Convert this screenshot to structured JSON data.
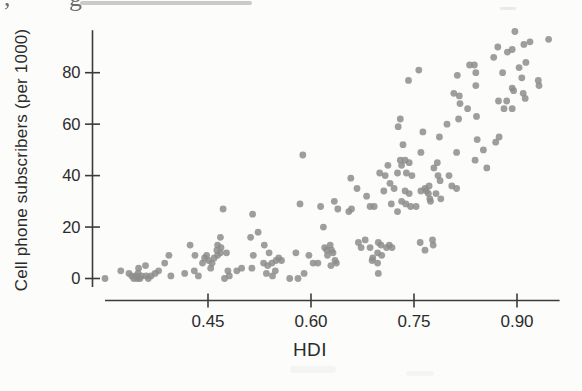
{
  "figure": {
    "artifact_text": ", g",
    "background": "#fcfcfa",
    "dot_color": "#8d8d8d",
    "axis_color": "#3b3b3b",
    "text_color": "#2b2b2b"
  },
  "chart_data": {
    "type": "scatter",
    "title": "",
    "xlabel": "HDI",
    "ylabel": "Cell phone subscribers (per 1000)",
    "x_ticks": [
      0.45,
      0.6,
      0.75,
      0.9
    ],
    "x_tick_labels": [
      "0.45",
      "0.60",
      "0.75",
      "0.90"
    ],
    "y_ticks": [
      0,
      20,
      40,
      60,
      80
    ],
    "y_tick_labels": [
      "0",
      "20",
      "40",
      "60",
      "80"
    ],
    "xlim": [
      0.3,
      0.962
    ],
    "ylim": [
      -8.5,
      96.5
    ],
    "grid": false,
    "legend": null,
    "points": [
      [
        0.3,
        0
      ],
      [
        0.323,
        3
      ],
      [
        0.335,
        2
      ],
      [
        0.339,
        1
      ],
      [
        0.342,
        0
      ],
      [
        0.345,
        1
      ],
      [
        0.348,
        2
      ],
      [
        0.347,
        0
      ],
      [
        0.351,
        0
      ],
      [
        0.353,
        1
      ],
      [
        0.349,
        4
      ],
      [
        0.359,
        5
      ],
      [
        0.36,
        1
      ],
      [
        0.363,
        0
      ],
      [
        0.367,
        1
      ],
      [
        0.373,
        2
      ],
      [
        0.378,
        3
      ],
      [
        0.387,
        6
      ],
      [
        0.393,
        9
      ],
      [
        0.396,
        1
      ],
      [
        0.416,
        2
      ],
      [
        0.424,
        13
      ],
      [
        0.431,
        9
      ],
      [
        0.43,
        3
      ],
      [
        0.436,
        1
      ],
      [
        0.442,
        6
      ],
      [
        0.445,
        8
      ],
      [
        0.448,
        9
      ],
      [
        0.451,
        7
      ],
      [
        0.454,
        4
      ],
      [
        0.456,
        6
      ],
      [
        0.459,
        8
      ],
      [
        0.463,
        11
      ],
      [
        0.464,
        9
      ],
      [
        0.464,
        13
      ],
      [
        0.468,
        10
      ],
      [
        0.469,
        12
      ],
      [
        0.468,
        16
      ],
      [
        0.472,
        27
      ],
      [
        0.474,
        0
      ],
      [
        0.477,
        10
      ],
      [
        0.479,
        3
      ],
      [
        0.481,
        1
      ],
      [
        0.492,
        3
      ],
      [
        0.499,
        4
      ],
      [
        0.512,
        16
      ],
      [
        0.515,
        25
      ],
      [
        0.516,
        9
      ],
      [
        0.514,
        4
      ],
      [
        0.523,
        18
      ],
      [
        0.531,
        6
      ],
      [
        0.532,
        13
      ],
      [
        0.535,
        2
      ],
      [
        0.537,
        5
      ],
      [
        0.539,
        10
      ],
      [
        0.543,
        6
      ],
      [
        0.544,
        1
      ],
      [
        0.548,
        3
      ],
      [
        0.549,
        7
      ],
      [
        0.553,
        8
      ],
      [
        0.557,
        7
      ],
      [
        0.569,
        0
      ],
      [
        0.578,
        10
      ],
      [
        0.581,
        0
      ],
      [
        0.584,
        29
      ],
      [
        0.588,
        48
      ],
      [
        0.59,
        2
      ],
      [
        0.597,
        9
      ],
      [
        0.603,
        6
      ],
      [
        0.61,
        6
      ],
      [
        0.614,
        28
      ],
      [
        0.618,
        20
      ],
      [
        0.62,
        12
      ],
      [
        0.623,
        11
      ],
      [
        0.624,
        9
      ],
      [
        0.628,
        13
      ],
      [
        0.629,
        5
      ],
      [
        0.63,
        11
      ],
      [
        0.632,
        10
      ],
      [
        0.634,
        30
      ],
      [
        0.635,
        7
      ],
      [
        0.637,
        6
      ],
      [
        0.639,
        27
      ],
      [
        0.655,
        26
      ],
      [
        0.659,
        27
      ],
      [
        0.658,
        39
      ],
      [
        0.667,
        35
      ],
      [
        0.669,
        14
      ],
      [
        0.673,
        12
      ],
      [
        0.679,
        15
      ],
      [
        0.681,
        32
      ],
      [
        0.686,
        28
      ],
      [
        0.686,
        12
      ],
      [
        0.689,
        7
      ],
      [
        0.69,
        8
      ],
      [
        0.692,
        28
      ],
      [
        0.697,
        6
      ],
      [
        0.697,
        10
      ],
      [
        0.698,
        2
      ],
      [
        0.698,
        14
      ],
      [
        0.7,
        41
      ],
      [
        0.702,
        13
      ],
      [
        0.703,
        9
      ],
      [
        0.706,
        34
      ],
      [
        0.708,
        40
      ],
      [
        0.71,
        12
      ],
      [
        0.712,
        44
      ],
      [
        0.714,
        13
      ],
      [
        0.715,
        37
      ],
      [
        0.717,
        29
      ],
      [
        0.718,
        12
      ],
      [
        0.721,
        35
      ],
      [
        0.726,
        41
      ],
      [
        0.726,
        26
      ],
      [
        0.727,
        59
      ],
      [
        0.73,
        62
      ],
      [
        0.73,
        46
      ],
      [
        0.732,
        44
      ],
      [
        0.732,
        30
      ],
      [
        0.734,
        52
      ],
      [
        0.737,
        46
      ],
      [
        0.737,
        34
      ],
      [
        0.738,
        29
      ],
      [
        0.739,
        41
      ],
      [
        0.742,
        77
      ],
      [
        0.743,
        45
      ],
      [
        0.743,
        33
      ],
      [
        0.745,
        28
      ],
      [
        0.747,
        40
      ],
      [
        0.753,
        28
      ],
      [
        0.757,
        81
      ],
      [
        0.759,
        14
      ],
      [
        0.76,
        49
      ],
      [
        0.76,
        34
      ],
      [
        0.763,
        57
      ],
      [
        0.766,
        35
      ],
      [
        0.766,
        11
      ],
      [
        0.768,
        34
      ],
      [
        0.771,
        33
      ],
      [
        0.772,
        36
      ],
      [
        0.773,
        31
      ],
      [
        0.774,
        30
      ],
      [
        0.777,
        15
      ],
      [
        0.778,
        13
      ],
      [
        0.779,
        43
      ],
      [
        0.782,
        33
      ],
      [
        0.784,
        45
      ],
      [
        0.785,
        40
      ],
      [
        0.787,
        55
      ],
      [
        0.788,
        38
      ],
      [
        0.789,
        31
      ],
      [
        0.798,
        60
      ],
      [
        0.801,
        40
      ],
      [
        0.805,
        36
      ],
      [
        0.808,
        72
      ],
      [
        0.812,
        49
      ],
      [
        0.813,
        79
      ],
      [
        0.812,
        35
      ],
      [
        0.815,
        62
      ],
      [
        0.816,
        71
      ],
      [
        0.817,
        68
      ],
      [
        0.828,
        66
      ],
      [
        0.831,
        83
      ],
      [
        0.838,
        83
      ],
      [
        0.839,
        46
      ],
      [
        0.84,
        80
      ],
      [
        0.84,
        75
      ],
      [
        0.841,
        63
      ],
      [
        0.842,
        54
      ],
      [
        0.851,
        50
      ],
      [
        0.856,
        43
      ],
      [
        0.866,
        86
      ],
      [
        0.869,
        53
      ],
      [
        0.872,
        90
      ],
      [
        0.873,
        69
      ],
      [
        0.874,
        55
      ],
      [
        0.879,
        80
      ],
      [
        0.881,
        66
      ],
      [
        0.885,
        69
      ],
      [
        0.886,
        88
      ],
      [
        0.893,
        89
      ],
      [
        0.893,
        74
      ],
      [
        0.893,
        66
      ],
      [
        0.895,
        73
      ],
      [
        0.897,
        96
      ],
      [
        0.903,
        82
      ],
      [
        0.907,
        78
      ],
      [
        0.909,
        72
      ],
      [
        0.91,
        91
      ],
      [
        0.912,
        70
      ],
      [
        0.913,
        84
      ],
      [
        0.919,
        92
      ],
      [
        0.931,
        77
      ],
      [
        0.932,
        75
      ],
      [
        0.946,
        93
      ]
    ]
  }
}
